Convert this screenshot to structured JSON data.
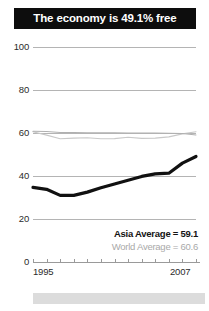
{
  "header": {
    "title": "The economy is 49.1% free",
    "banner_color": "#0d0d0d",
    "text_color": "#ffffff"
  },
  "legend": {
    "asia_label": "Asia Average = 59.1",
    "world_label": "World Average = 60.6",
    "asia_color": "#131313",
    "world_color": "#a9a9a9"
  },
  "chart_data": {
    "type": "line",
    "title": "The economy is 49.1% free",
    "xlabel": "",
    "ylabel": "",
    "xlim": [
      1995,
      2007
    ],
    "ylim": [
      0,
      100
    ],
    "yticks": [
      0,
      20,
      40,
      60,
      80,
      100
    ],
    "ytick_labels": [
      "0",
      "20",
      "40",
      "60",
      "80",
      "100"
    ],
    "xticks": [
      1995,
      1996,
      1997,
      1998,
      1999,
      2000,
      2001,
      2002,
      2003,
      2004,
      2005,
      2006,
      2007
    ],
    "xtick_labels_shown": [
      "1995",
      "2007"
    ],
    "grid": true,
    "grid_axis": "y",
    "legend_position": "bottom-right",
    "x": [
      1995,
      1996,
      1997,
      1998,
      1999,
      2000,
      2001,
      2002,
      2003,
      2004,
      2005,
      2006,
      2007
    ],
    "series": [
      {
        "name": "Country score",
        "color": "#111111",
        "linewidth": 3.2,
        "values": [
          34.7,
          33.8,
          31.0,
          31.0,
          32.5,
          34.5,
          36.3,
          38.0,
          39.8,
          41.0,
          41.3,
          46.0,
          49.1
        ]
      },
      {
        "name": "World Average = 60.6",
        "color": "#c9c9c9",
        "linewidth": 1.1,
        "values": [
          60.6,
          59.0,
          57.3,
          57.6,
          57.8,
          57.3,
          57.4,
          58.0,
          57.5,
          57.6,
          58.2,
          59.6,
          60.6
        ]
      },
      {
        "name": "Asia Average = 59.1",
        "color": "#b0b0b0",
        "linewidth": 1.1,
        "values": [
          60.8,
          60.7,
          60.2,
          60.2,
          60.1,
          60.1,
          60.1,
          60.0,
          60.0,
          60.0,
          59.9,
          59.8,
          59.1
        ]
      }
    ]
  },
  "footer": {
    "strip_color": "#dcdcdc"
  }
}
